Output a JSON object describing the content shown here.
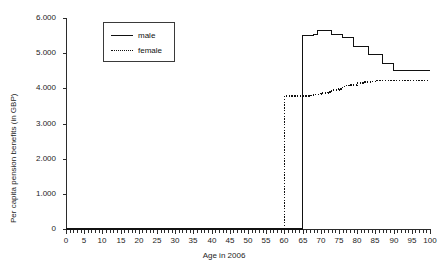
{
  "chart_data": {
    "type": "line",
    "title": "",
    "xlabel": "Age in 2006",
    "ylabel": "Per capita pension benefits (in GBP)",
    "xlim": [
      0,
      100
    ],
    "ylim": [
      0,
      6000
    ],
    "grid": false,
    "legend_position": "upper-left-inside",
    "x_tick_labels": [
      "0",
      "5",
      "10",
      "15",
      "20",
      "25",
      "30",
      "35",
      "40",
      "45",
      "50",
      "55",
      "60",
      "65",
      "70",
      "75",
      "80",
      "85",
      "90",
      "95",
      "100"
    ],
    "x_tick_values": [
      0,
      5,
      10,
      15,
      20,
      25,
      30,
      35,
      40,
      45,
      50,
      55,
      60,
      65,
      70,
      75,
      80,
      85,
      90,
      95,
      100
    ],
    "x_minor_tick_step": 1,
    "y_tick_labels": [
      "0",
      "1.000",
      "2.000",
      "3.000",
      "4.000",
      "5.000",
      "6.000"
    ],
    "y_tick_values": [
      0,
      1000,
      2000,
      3000,
      4000,
      5000,
      6000
    ],
    "series": [
      {
        "name": "male",
        "style": "solid",
        "color": "#111111",
        "x": [
          0,
          1,
          2,
          3,
          4,
          5,
          6,
          7,
          8,
          9,
          10,
          11,
          12,
          13,
          14,
          15,
          16,
          17,
          18,
          19,
          20,
          21,
          22,
          23,
          24,
          25,
          26,
          27,
          28,
          29,
          30,
          31,
          32,
          33,
          34,
          35,
          36,
          37,
          38,
          39,
          40,
          41,
          42,
          43,
          44,
          45,
          46,
          47,
          48,
          49,
          50,
          51,
          52,
          53,
          54,
          55,
          56,
          57,
          58,
          59,
          60,
          61,
          62,
          63,
          64,
          65,
          66,
          67,
          68,
          69,
          70,
          71,
          72,
          73,
          74,
          75,
          76,
          77,
          78,
          79,
          80,
          81,
          82,
          83,
          84,
          85,
          86,
          87,
          88,
          89,
          90,
          91,
          92,
          93,
          94,
          95,
          96,
          97,
          98,
          99,
          100
        ],
        "y": [
          0,
          0,
          0,
          0,
          0,
          0,
          0,
          0,
          0,
          0,
          0,
          0,
          0,
          0,
          0,
          0,
          0,
          0,
          0,
          0,
          0,
          0,
          0,
          0,
          0,
          0,
          0,
          0,
          0,
          0,
          0,
          0,
          0,
          0,
          0,
          0,
          0,
          0,
          0,
          0,
          0,
          0,
          0,
          0,
          0,
          0,
          0,
          0,
          0,
          0,
          0,
          0,
          0,
          0,
          0,
          0,
          0,
          0,
          0,
          0,
          0,
          0,
          0,
          0,
          0,
          5500,
          5500,
          5500,
          5520,
          5650,
          5650,
          5650,
          5650,
          5520,
          5520,
          5520,
          5450,
          5450,
          5450,
          5200,
          5200,
          5200,
          5200,
          4950,
          4950,
          4950,
          4950,
          4700,
          4700,
          4700,
          4500,
          4500,
          4500,
          4500,
          4500,
          4500,
          4500,
          4500,
          4500,
          4500,
          4500
        ]
      },
      {
        "name": "female",
        "style": "dotted",
        "color": "#111111",
        "x": [
          0,
          1,
          2,
          3,
          4,
          5,
          6,
          7,
          8,
          9,
          10,
          11,
          12,
          13,
          14,
          15,
          16,
          17,
          18,
          19,
          20,
          21,
          22,
          23,
          24,
          25,
          26,
          27,
          28,
          29,
          30,
          31,
          32,
          33,
          34,
          35,
          36,
          37,
          38,
          39,
          40,
          41,
          42,
          43,
          44,
          45,
          46,
          47,
          48,
          49,
          50,
          51,
          52,
          53,
          54,
          55,
          56,
          57,
          58,
          59,
          60,
          61,
          62,
          63,
          64,
          65,
          66,
          67,
          68,
          69,
          70,
          71,
          72,
          73,
          74,
          75,
          76,
          77,
          78,
          79,
          80,
          81,
          82,
          83,
          84,
          85,
          86,
          87,
          88,
          89,
          90,
          91,
          92,
          93,
          94,
          95,
          96,
          97,
          98,
          99,
          100
        ],
        "y": [
          0,
          0,
          0,
          0,
          0,
          0,
          0,
          0,
          0,
          0,
          0,
          0,
          0,
          0,
          0,
          0,
          0,
          0,
          0,
          0,
          0,
          0,
          0,
          0,
          0,
          0,
          0,
          0,
          0,
          0,
          0,
          0,
          0,
          0,
          0,
          0,
          0,
          0,
          0,
          0,
          0,
          0,
          0,
          0,
          0,
          0,
          0,
          0,
          0,
          0,
          0,
          0,
          0,
          0,
          0,
          0,
          0,
          0,
          0,
          0,
          3780,
          3780,
          3780,
          3780,
          3780,
          3780,
          3780,
          3800,
          3830,
          3830,
          3870,
          3870,
          3900,
          3950,
          3950,
          3980,
          4050,
          4080,
          4100,
          4100,
          4150,
          4150,
          4180,
          4180,
          4200,
          4230,
          4230,
          4230,
          4230,
          4230,
          4230,
          4230,
          4230,
          4230,
          4230,
          4230,
          4230,
          4230,
          4230,
          4230,
          4230
        ]
      }
    ]
  },
  "legend": {
    "items": [
      {
        "label": "male",
        "style": "solid"
      },
      {
        "label": "female",
        "style": "dotted"
      }
    ]
  }
}
